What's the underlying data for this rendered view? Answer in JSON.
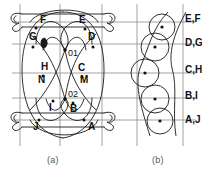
{
  "figure": {
    "caption_a": "(a)",
    "caption_b": "(b)"
  },
  "panel_a": {
    "name": "braid-knot-diagram",
    "node_labels": [
      {
        "id": "F",
        "text": "F",
        "x": 40,
        "y": 23,
        "dot_x": 36,
        "dot_y": 28
      },
      {
        "id": "E",
        "text": "E",
        "x": 79,
        "y": 23,
        "dot_x": 85,
        "dot_y": 29
      },
      {
        "id": "G",
        "text": "G",
        "x": 32,
        "y": 40,
        "dot_x": 33,
        "dot_y": 47
      },
      {
        "id": "D",
        "text": "D",
        "x": 90,
        "y": 40,
        "dot_x": 93,
        "dot_y": 47
      },
      {
        "id": "O1",
        "text": "01",
        "x": 69,
        "y": 55,
        "dot_x": 65,
        "dot_y": 50
      },
      {
        "id": "H",
        "text": "H",
        "x": 45,
        "y": 69,
        "dot_x": 43,
        "dot_y": 76
      },
      {
        "id": "C",
        "text": "C",
        "x": 80,
        "y": 70,
        "dot_x": 82,
        "dot_y": 77
      },
      {
        "id": "N",
        "text": "N",
        "x": 41,
        "y": 82,
        "dot_x": 0,
        "dot_y": 0
      },
      {
        "id": "M",
        "text": "M",
        "x": 83,
        "y": 82,
        "dot_x": 0,
        "dot_y": 0
      },
      {
        "id": "O2",
        "text": "02",
        "x": 70,
        "y": 99,
        "dot_x": 65,
        "dot_y": 99
      },
      {
        "id": "I",
        "text": "I",
        "x": 50,
        "y": 110,
        "dot_x": 53,
        "dot_y": 101
      },
      {
        "id": "B",
        "text": "B",
        "x": 73,
        "y": 110,
        "dot_x": 73,
        "dot_y": 103
      },
      {
        "id": "J",
        "text": "J",
        "x": 34,
        "y": 128,
        "dot_x": 39,
        "dot_y": 120
      },
      {
        "id": "A",
        "text": "A",
        "x": 90,
        "y": 128,
        "dot_x": 84,
        "dot_y": 120
      }
    ],
    "grid": {
      "horizontal_y": [
        22,
        44,
        73,
        98,
        120
      ],
      "vertical_x": [
        20,
        60,
        102,
        137,
        183
      ]
    },
    "accent_node_color": "#1a1a1a"
  },
  "panel_b": {
    "name": "circle-band-diagram",
    "circles": [
      {
        "cx": 162,
        "cy": 27,
        "r": 13
      },
      {
        "cx": 155,
        "cy": 47,
        "r": 14
      },
      {
        "cx": 145,
        "cy": 73,
        "r": 14
      },
      {
        "cx": 155,
        "cy": 99,
        "r": 14
      },
      {
        "cx": 160,
        "cy": 121,
        "r": 13
      }
    ],
    "row_labels": [
      {
        "text": "E,F",
        "x": 184,
        "y": 22
      },
      {
        "text": "D,G",
        "x": 184,
        "y": 45
      },
      {
        "text": "C,H",
        "x": 184,
        "y": 72
      },
      {
        "text": "B,I",
        "x": 184,
        "y": 98
      },
      {
        "text": "A,J",
        "x": 184,
        "y": 122
      }
    ]
  },
  "colors": {
    "stroke": "#1a1a1a",
    "grid": "#8c8c8c",
    "text": "#111111",
    "caption": "#555555",
    "background": "#ffffff"
  }
}
